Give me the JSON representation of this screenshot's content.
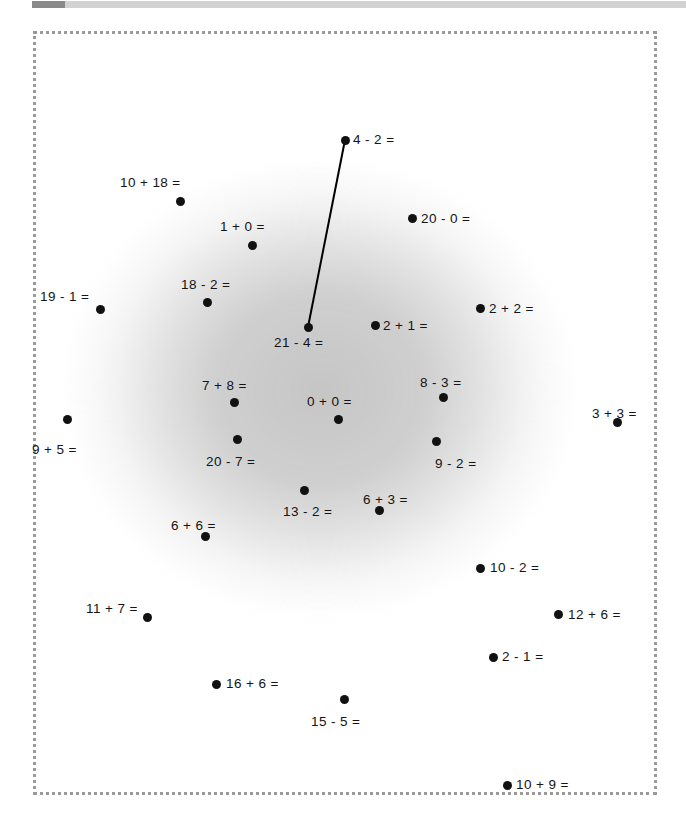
{
  "topbar": {
    "name": "horizontal-scrollbar",
    "thumb_position_pct": 0,
    "track_color": "#d2d2d2",
    "thumb_color": "#8a8a8a"
  },
  "canvas": {
    "background_color": "#ffffff",
    "frame_style": "dotted",
    "frame_color": "#9a9a9a",
    "smudge_color": "#969696"
  },
  "annotations": {
    "point_color": "#111111",
    "label_color": "#141414",
    "link_color": "#000000",
    "items": [
      {
        "label": "4 - 2 =",
        "x": 345,
        "y": 131,
        "lx": 353,
        "ly": 124
      },
      {
        "label": "10 + 18 =",
        "x": 180,
        "y": 192,
        "lx": 120,
        "ly": 167
      },
      {
        "label": "1 + 0 =",
        "x": 252,
        "y": 236,
        "lx": 220,
        "ly": 211
      },
      {
        "label": "20 - 0 =",
        "x": 412,
        "y": 209,
        "lx": 421,
        "ly": 203
      },
      {
        "label": "19 - 1 =",
        "x": 100,
        "y": 300,
        "lx": 40,
        "ly": 281
      },
      {
        "label": "18 - 2 =",
        "x": 207,
        "y": 293,
        "lx": 181,
        "ly": 269
      },
      {
        "label": "2 + 2 =",
        "x": 480,
        "y": 299,
        "lx": 489,
        "ly": 293
      },
      {
        "label": "21 - 4 =",
        "x": 308,
        "y": 318,
        "lx": 274,
        "ly": 327
      },
      {
        "label": "2 + 1 =",
        "x": 375,
        "y": 316,
        "lx": 383,
        "ly": 310
      },
      {
        "label": "7 + 8 =",
        "x": 234,
        "y": 393,
        "lx": 202,
        "ly": 370
      },
      {
        "label": "0 + 0 =",
        "x": 338,
        "y": 410,
        "lx": 307,
        "ly": 386
      },
      {
        "label": "8 - 3 =",
        "x": 443,
        "y": 388,
        "lx": 420,
        "ly": 367
      },
      {
        "label": "3 + 3 =",
        "x": 617,
        "y": 413,
        "lx": 592,
        "ly": 398
      },
      {
        "label": "9 + 5 =",
        "x": 67,
        "y": 410,
        "lx": 32,
        "ly": 434
      },
      {
        "label": "20 - 7 =",
        "x": 237,
        "y": 430,
        "lx": 206,
        "ly": 446
      },
      {
        "label": "9 - 2 =",
        "x": 436,
        "y": 432,
        "lx": 435,
        "ly": 448
      },
      {
        "label": "13 - 2 =",
        "x": 304,
        "y": 481,
        "lx": 283,
        "ly": 496
      },
      {
        "label": "6 + 3 =",
        "x": 379,
        "y": 501,
        "lx": 363,
        "ly": 484
      },
      {
        "label": "6 + 6 =",
        "x": 205,
        "y": 527,
        "lx": 171,
        "ly": 510
      },
      {
        "label": "10 - 2 =",
        "x": 480,
        "y": 559,
        "lx": 490,
        "ly": 552
      },
      {
        "label": "11 + 7 =",
        "x": 147,
        "y": 608,
        "lx": 86,
        "ly": 593
      },
      {
        "label": "12 + 6 =",
        "x": 558,
        "y": 605,
        "lx": 568,
        "ly": 599
      },
      {
        "label": "2 - 1 =",
        "x": 493,
        "y": 648,
        "lx": 502,
        "ly": 641
      },
      {
        "label": "16 + 6 =",
        "x": 216,
        "y": 675,
        "lx": 226,
        "ly": 668
      },
      {
        "label": "15 - 5 =",
        "x": 344,
        "y": 690,
        "lx": 311,
        "ly": 706
      },
      {
        "label": "10 + 9 =",
        "x": 507,
        "y": 776,
        "lx": 516,
        "ly": 769
      }
    ],
    "links": [
      {
        "from": "4 - 2 =",
        "to": "21 - 4 =",
        "x1": 345,
        "y1": 131,
        "x2": 308,
        "y2": 318
      }
    ]
  }
}
